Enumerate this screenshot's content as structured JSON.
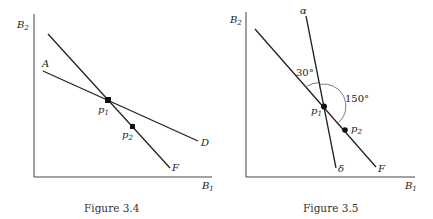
{
  "figures": [
    {
      "caption": "Figure 3.4",
      "axes": {
        "y_label": "B",
        "y_sub": "2",
        "x_label": "B",
        "x_sub": "1"
      },
      "lines": [
        {
          "end_label": "A",
          "start_label": "",
          "terminal_label": "D"
        },
        {
          "terminal_label": "F"
        }
      ],
      "points": [
        {
          "label": "p",
          "sub": "1"
        },
        {
          "label": "p",
          "sub": "2"
        }
      ]
    },
    {
      "caption": "Figure 3.5",
      "axes": {
        "y_label": "B",
        "y_sub": "2",
        "x_label": "B",
        "x_sub": "1"
      },
      "lines": [
        {
          "start_label": "α",
          "terminal_label": "δ"
        },
        {
          "terminal_label": "F"
        }
      ],
      "angles": [
        {
          "label": "30°"
        },
        {
          "label": "150°"
        }
      ],
      "points": [
        {
          "label": "p",
          "sub": "1"
        },
        {
          "label": "p",
          "sub": "2"
        }
      ]
    }
  ],
  "colors": {
    "ink": "#222222",
    "background": "#ffffff"
  }
}
